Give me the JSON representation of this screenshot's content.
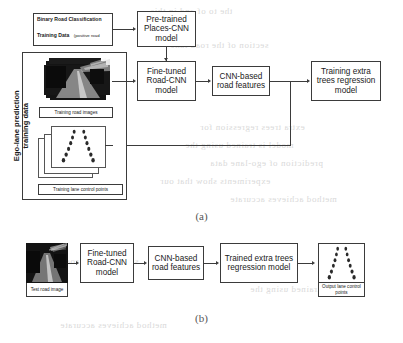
{
  "figure": {
    "panel_a_caption": "(a)",
    "panel_b_caption": "(b)"
  },
  "panel_a": {
    "group_label_line1": "Ego-lane prediction",
    "group_label_line2": "training data",
    "training_data_title": "Binary Road Classification",
    "training_data_subtitle_bold": "Training Data",
    "training_data_subtitle": "(positive road samples and negative non-road samples)",
    "boxes": {
      "places_cnn": "Pre-trained Places-CNN model",
      "road_cnn": "Fine-tuned Road-CNN model",
      "features": "CNN-based road features",
      "regression": "Training extra trees regression model"
    },
    "captions": {
      "road_images": "Training road images",
      "lane_points": "Training lane control points"
    }
  },
  "panel_b": {
    "test_image_caption": "Test road image",
    "boxes": {
      "road_cnn": "Fine-tuned Road-CNN model",
      "features": "CNN-based road features",
      "regression": "Trained extra trees regression model"
    },
    "output_caption": "Output lane control points"
  },
  "colors": {
    "stroke": "#3b3b3b",
    "background": "#ffffff",
    "bleed_text": "#d9d9d9"
  },
  "bleed_text": {
    "lines": [
      "the   to   of   and   in   this",
      "section   of   the   road   lane",
      "extra   trees   regression   for",
      "model   is   trained   using   the",
      "prediction   of   ego-lane   data",
      "experiments   show   that   our",
      "method   achieves   accurate"
    ]
  }
}
